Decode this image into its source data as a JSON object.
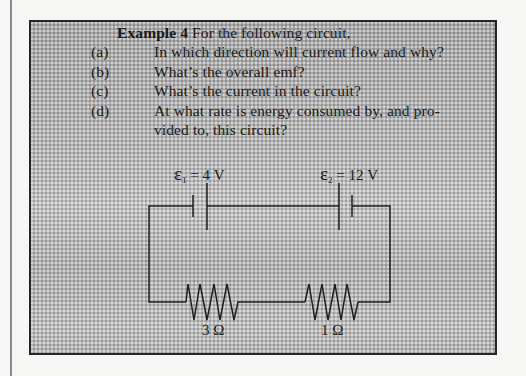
{
  "example": {
    "heading": "Example 4",
    "intro": "For the following circuit,",
    "questions": [
      {
        "label": "(a)",
        "text": "In which direction will current flow and why?"
      },
      {
        "label": "(b)",
        "text": "What’s the overall emf?"
      },
      {
        "label": "(c)",
        "text": "What’s the current in the circuit?"
      },
      {
        "label": "(d)",
        "text": "At what rate is energy consumed by, and pro-",
        "continuation": "vided to, this circuit?"
      }
    ]
  },
  "circuit": {
    "battery1": {
      "symbol": "ε",
      "subscript": "1",
      "value": "= 4 V"
    },
    "battery2": {
      "symbol": "ε",
      "subscript": "2",
      "value": "= 12 V"
    },
    "resistor1": {
      "label": "3 Ω"
    },
    "resistor2": {
      "label": "1 Ω"
    }
  },
  "colors": {
    "page": "#f6f6f4",
    "box_fill": "#b3b3b3",
    "ink": "#1a1a1a"
  }
}
